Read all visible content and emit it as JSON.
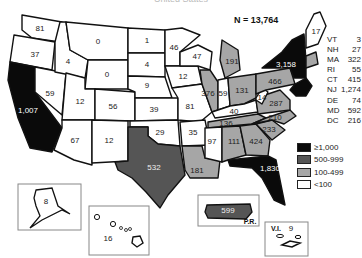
{
  "title": "United States",
  "total_label": "N = 13,764",
  "colors": {
    "gte1000": "#0a0a0a",
    "500_999": "#555555",
    "100_499": "#a6a6a6",
    "lt100": "#ffffff"
  },
  "legend": [
    {
      "label": "≥1,000",
      "class": "gte1000"
    },
    {
      "label": "500-999",
      "class": "500_999"
    },
    {
      "label": "100-499",
      "class": "100_499"
    },
    {
      "label": "<100",
      "class": "lt100"
    }
  ],
  "northeast_table": [
    {
      "state": "VT",
      "value": "3"
    },
    {
      "state": "NH",
      "value": "27"
    },
    {
      "state": "MA",
      "value": "322"
    },
    {
      "state": "RI",
      "value": "55"
    },
    {
      "state": "CT",
      "value": "415"
    },
    {
      "state": "NJ",
      "value": "1,274"
    },
    {
      "state": "DE",
      "value": "74"
    },
    {
      "state": "MD",
      "value": "592"
    },
    {
      "state": "DC",
      "value": "216"
    }
  ],
  "states": [
    {
      "id": "WA",
      "value": "81",
      "class": "lt100",
      "points": "22,15 62,22 60,42 32,38 22,30",
      "lx": 40,
      "ly": 29,
      "lc": "#222"
    },
    {
      "id": "OR",
      "value": "37",
      "class": "lt100",
      "points": "14,35 32,38 55,42 52,70 10,62",
      "lx": 35,
      "ly": 55,
      "lc": "#222"
    },
    {
      "id": "CA",
      "value": "1,007",
      "class": "gte1000",
      "points": "10,62 35,67 35,92 62,128 52,152 30,148 18,118 8,80",
      "lx": 28,
      "ly": 111,
      "lc": "#fff"
    },
    {
      "id": "NV",
      "value": "59",
      "class": "lt100",
      "points": "35,67 66,73 62,115 35,92",
      "lx": 50,
      "ly": 94,
      "lc": "#222"
    },
    {
      "id": "ID",
      "value": "4",
      "class": "lt100",
      "points": "60,22 66,22 70,50 88,60 85,78 55,72 55,42",
      "lx": 68,
      "ly": 62,
      "lc": "#222"
    },
    {
      "id": "MT",
      "value": "0",
      "class": "lt100",
      "points": "66,22 128,28 128,60 88,60 70,50",
      "lx": 98,
      "ly": 42,
      "lc": "#222"
    },
    {
      "id": "WY",
      "value": "0",
      "class": "lt100",
      "points": "88,60 128,60 128,89 85,89",
      "lx": 107,
      "ly": 75,
      "lc": "#222"
    },
    {
      "id": "UT",
      "value": "12",
      "class": "lt100",
      "points": "66,73 85,78 85,89 95,89 95,120 62,120",
      "lx": 80,
      "ly": 102,
      "lc": "#222"
    },
    {
      "id": "CO",
      "value": "56",
      "class": "lt100",
      "points": "95,89 135,92 135,121 95,120",
      "lx": 113,
      "ly": 107,
      "lc": "#222"
    },
    {
      "id": "AZ",
      "value": "67",
      "class": "lt100",
      "points": "62,120 92,120 92,165 74,160 54,150 62,128",
      "lx": 75,
      "ly": 141,
      "lc": "#222"
    },
    {
      "id": "NM",
      "value": "12",
      "class": "lt100",
      "points": "92,120 128,121 128,161 92,163",
      "lx": 109,
      "ly": 141,
      "lc": "#222"
    },
    {
      "id": "ND",
      "value": "1",
      "class": "lt100",
      "points": "128,28 165,30 165,53 128,53",
      "lx": 147,
      "ly": 41,
      "lc": "#222"
    },
    {
      "id": "SD",
      "value": "4",
      "class": "lt100",
      "points": "128,53 165,53 165,77 128,76",
      "lx": 147,
      "ly": 65,
      "lc": "#222"
    },
    {
      "id": "NE",
      "value": "9",
      "class": "lt100",
      "points": "128,76 165,77 172,98 135,98 135,92 128,89",
      "lx": 147,
      "ly": 86,
      "lc": "#222"
    },
    {
      "id": "KS",
      "value": "39",
      "class": "lt100",
      "points": "135,98 178,98 178,120 135,121",
      "lx": 154,
      "ly": 110,
      "lc": "#222"
    },
    {
      "id": "OK",
      "value": "29",
      "class": "lt100",
      "points": "130,121 178,120 180,146 158,144 148,136 148,127 130,127",
      "lx": 160,
      "ly": 133,
      "lc": "#222"
    },
    {
      "id": "TX",
      "value": "532",
      "class": "500_999",
      "points": "128,127 148,127 148,136 158,144 180,146 185,175 168,195 160,208 146,192 132,178 118,170 115,162 128,161",
      "lx": 154,
      "ly": 168,
      "lc": "#eee"
    },
    {
      "id": "MN",
      "value": "46",
      "class": "lt100",
      "points": "165,30 182,28 200,35 180,52 180,66 165,66",
      "lx": 174,
      "ly": 48,
      "lc": "#222"
    },
    {
      "id": "IA",
      "value": "12",
      "class": "lt100",
      "points": "165,66 198,66 202,84 172,88",
      "lx": 183,
      "ly": 77,
      "lc": "#222"
    },
    {
      "id": "MO",
      "value": "81",
      "class": "lt100",
      "points": "172,88 202,84 212,112 200,122 178,120 178,98",
      "lx": 190,
      "ly": 107,
      "lc": "#222"
    },
    {
      "id": "AR",
      "value": "35",
      "class": "lt100",
      "points": "180,122 205,120 210,145 182,146",
      "lx": 193,
      "ly": 133,
      "lc": "#222"
    },
    {
      "id": "LA",
      "value": "181",
      "class": "100_499",
      "points": "182,146 202,146 205,158 220,160 218,178 190,178 185,170",
      "lx": 197,
      "ly": 171,
      "lc": "#222"
    },
    {
      "id": "WI",
      "value": "47",
      "class": "lt100",
      "points": "180,52 198,45 212,52 210,70 198,66 180,66",
      "lx": 197,
      "ly": 57,
      "lc": "#222"
    },
    {
      "id": "IL",
      "value": "376",
      "class": "100_499",
      "points": "200,70 210,70 218,82 218,110 212,112 202,84",
      "lx": 208,
      "ly": 94,
      "lc": "#222"
    },
    {
      "id": "MI",
      "value": "191",
      "class": "100_499",
      "points": "222,40 238,50 240,70 225,78 220,60",
      "lx": 232,
      "ly": 62,
      "lc": "#222"
    },
    {
      "id": "IN",
      "value": "59",
      "class": "lt100",
      "points": "218,80 228,78 230,106 218,110",
      "lx": 223,
      "ly": 94,
      "lc": "#222"
    },
    {
      "id": "OH",
      "value": "131",
      "class": "100_499",
      "points": "228,78 256,74 256,98 244,104 230,106",
      "lx": 242,
      "ly": 91,
      "lc": "#222"
    },
    {
      "id": "KY",
      "value": "40",
      "class": "lt100",
      "points": "212,112 230,106 244,104 256,100 258,112 215,118",
      "lx": 234,
      "ly": 112,
      "lc": "#222"
    },
    {
      "id": "TN",
      "value": "136",
      "class": "100_499",
      "points": "208,122 258,114 266,118 252,124 208,128",
      "lx": 226,
      "ly": 124,
      "lc": "#222"
    },
    {
      "id": "MS",
      "value": "97",
      "class": "lt100",
      "points": "205,128 222,127 222,162 205,158",
      "lx": 212,
      "ly": 142,
      "lc": "#222"
    },
    {
      "id": "AL",
      "value": "111",
      "class": "100_499",
      "points": "222,127 240,126 246,155 228,160 222,162",
      "lx": 234,
      "ly": 142,
      "lc": "#222"
    },
    {
      "id": "GA",
      "value": "424",
      "class": "100_499",
      "points": "240,126 256,124 270,140 268,156 246,155",
      "lx": 256,
      "ly": 142,
      "lc": "#222"
    },
    {
      "id": "FL",
      "value": "1,830",
      "class": "gte1000",
      "points": "228,160 268,156 276,160 280,180 285,205 274,200 262,178 252,168 230,166",
      "lx": 270,
      "ly": 169,
      "lc": "#fff"
    },
    {
      "id": "SC",
      "value": "233",
      "class": "100_499",
      "points": "256,124 272,120 285,130 272,140",
      "lx": 269,
      "ly": 130,
      "lc": "#222"
    },
    {
      "id": "NC",
      "value": "210",
      "class": "100_499",
      "points": "252,124 266,118 290,110 296,116 284,124 272,120",
      "lx": 275,
      "ly": 118,
      "lc": "#222"
    },
    {
      "id": "VA",
      "value": "287",
      "class": "100_499",
      "points": "256,100 262,96 280,90 290,100 290,110 258,114",
      "lx": 276,
      "ly": 104,
      "lc": "#222"
    },
    {
      "id": "WV",
      "value": "14",
      "class": "lt100",
      "points": "256,98 262,88 268,92 262,104 256,100",
      "lx": 262,
      "ly": 98,
      "lc": "#222"
    },
    {
      "id": "PA",
      "value": "466",
      "class": "100_499",
      "points": "256,74 290,68 295,84 266,90 256,94",
      "lx": 275,
      "ly": 82,
      "lc": "#222"
    },
    {
      "id": "NY",
      "value": "3,158",
      "class": "gte1000",
      "points": "262,68 282,52 292,40 304,34 306,60 306,78 294,78 290,68",
      "lx": 286,
      "ly": 65,
      "lc": "#fff"
    },
    {
      "id": "NE_states",
      "value": "",
      "class": "gte1000",
      "points": "295,84 306,78 312,86 306,96 296,96 290,90",
      "lx": 0,
      "ly": 0,
      "lc": "#fff"
    },
    {
      "id": "MA_CT_RI",
      "value": "",
      "class": "100_499",
      "points": "306,56 316,52 318,64 306,68",
      "lx": 0,
      "ly": 0,
      "lc": "#fff"
    },
    {
      "id": "ME",
      "value": "17",
      "class": "lt100",
      "points": "306,30 314,14 320,12 326,26 318,44 306,48",
      "lx": 316,
      "ly": 32,
      "lc": "#222"
    }
  ],
  "insets": {
    "alaska": {
      "label": "8"
    },
    "hawaii": {
      "label": "16"
    },
    "puerto_rico": {
      "label": "599",
      "caption": "P.R."
    },
    "virgin_islands": {
      "label": "9",
      "caption": "V.I."
    }
  },
  "chart_data": {
    "type": "choropleth",
    "title": "United States",
    "total": "N = 13,764",
    "bins": [
      "≥1,000",
      "500-999",
      "100-499",
      "<100"
    ],
    "values": {
      "WA": 81,
      "OR": 37,
      "CA": 1007,
      "NV": 59,
      "ID": 4,
      "MT": 0,
      "WY": 0,
      "UT": 12,
      "CO": 56,
      "AZ": 67,
      "NM": 12,
      "ND": 1,
      "SD": 4,
      "NE": 9,
      "KS": 39,
      "OK": 29,
      "TX": 532,
      "MN": 46,
      "IA": 12,
      "MO": 81,
      "AR": 35,
      "LA": 181,
      "WI": 47,
      "IL": 376,
      "MI": 191,
      "IN": 59,
      "OH": 131,
      "KY": 40,
      "TN": 136,
      "MS": 97,
      "AL": 111,
      "GA": 424,
      "FL": 1830,
      "SC": 233,
      "NC": 210,
      "VA": 287,
      "WV": 14,
      "PA": 466,
      "NY": 3158,
      "ME": 17,
      "VT": 3,
      "NH": 27,
      "MA": 322,
      "RI": 55,
      "CT": 415,
      "NJ": 1274,
      "DE": 74,
      "MD": 592,
      "DC": 216,
      "AK": 8,
      "HI": 16,
      "PR": 599,
      "VI": 9
    }
  }
}
